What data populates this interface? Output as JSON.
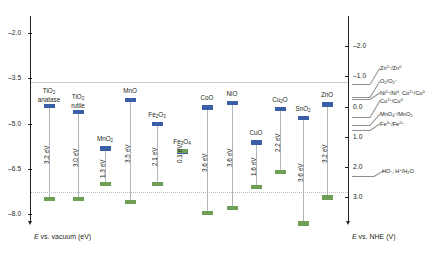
{
  "figure": {
    "left_axis_caption": "E vs. vacuum (eV)",
    "right_axis_caption": "E vs. NHE (V)"
  },
  "left_axis": {
    "ticks": [
      "-2.0",
      "-3.5",
      "-5.0",
      "-6.5",
      "-8.0"
    ],
    "values": [
      -2.0,
      -3.5,
      -5.0,
      -6.5,
      -8.0
    ]
  },
  "right_axis": {
    "ticks": [
      "-2.0",
      "-1.0",
      "0.0",
      "1.0",
      "2.0",
      "3.0"
    ],
    "values": [
      -2.0,
      -1.0,
      0.0,
      1.0,
      2.0,
      3.0
    ]
  },
  "redox_couples": [
    {
      "label": "Zn2+/Zn0",
      "value": -0.76
    },
    {
      "label": "O2/O2-",
      "value": -0.33
    },
    {
      "label": "Ni2+/Ni0, Co2+/Co0",
      "value": -0.26
    },
    {
      "label": "Cu2+/Cu0",
      "value": 0.34
    },
    {
      "label": "MnO4-/MnO2",
      "value": 0.6
    },
    {
      "label": "Fe3+/Fe2+",
      "value": 0.77
    },
    {
      "label": "HO., H+/H2O",
      "value": 2.3
    }
  ],
  "chart_data": {
    "type": "bar",
    "title": "",
    "xlabel": "",
    "ylabel": "E vs. vacuum (eV)",
    "ylim": [
      -8.6,
      -1.4
    ],
    "y2label": "E vs. NHE (V)",
    "y2lim": [
      4.1,
      -3.1
    ],
    "grid": false,
    "legend": "none",
    "reference_lines": [
      -4.5,
      -7.4
    ],
    "categories": [
      "TiO2 anatase",
      "TiO2 rutile",
      "MnO2",
      "MnO",
      "Fe2O3",
      "Fe3O4",
      "CoO",
      "NiO",
      "CuO",
      "Cu2O",
      "SnO2",
      "ZnO"
    ],
    "series": [
      {
        "name": "Conduction band edge (eV)",
        "values": [
          -4.35,
          -4.55,
          -5.75,
          -4.15,
          -4.95,
          -5.85,
          -4.4,
          -4.25,
          -5.55,
          -4.45,
          -4.75,
          -4.3
        ]
      },
      {
        "name": "Valence band edge (eV)",
        "values": [
          -7.55,
          -7.55,
          -7.05,
          -7.65,
          -7.05,
          -5.95,
          -8.0,
          -7.85,
          -7.15,
          -6.65,
          -8.35,
          -7.5
        ]
      },
      {
        "name": "Band gap (eV)",
        "values": [
          3.2,
          3.0,
          1.3,
          3.5,
          2.1,
          0.1,
          3.6,
          3.6,
          1.6,
          2.2,
          3.6,
          3.2
        ]
      }
    ],
    "gap_labels": [
      "3.2 eV",
      "3.0 eV",
      "1.3 eV",
      "3.5 eV",
      "2.1 eV",
      "0.1 eV",
      "3.6 eV",
      "3.6 eV",
      "1.6 eV",
      "2.2 eV",
      "3.6 eV",
      "3.2 eV"
    ],
    "colors": {
      "conduction_band": "#3b5ea8",
      "valence_band": "#6f9e55",
      "stem": "#b4b7b9",
      "axis": "#231f20"
    }
  },
  "materials": [
    {
      "name_html": "TiO<sub>2</sub><br>anatase",
      "gap": "3.2 eV"
    },
    {
      "name_html": "TiO<sub>2</sub><br>rutile",
      "gap": "3.0 eV"
    },
    {
      "name_html": "MnO<sub>2</sub>",
      "gap": "1.3 eV"
    },
    {
      "name_html": "MnO",
      "gap": "3.5 eV"
    },
    {
      "name_html": "Fe<sub>2</sub>O<sub>3</sub>",
      "gap": "2.1 eV"
    },
    {
      "name_html": "Fe<sub>3</sub>O<sub>4</sub>",
      "gap": "0.1 eV"
    },
    {
      "name_html": "CoO",
      "gap": "3.6 eV"
    },
    {
      "name_html": "NiO",
      "gap": "3.6 eV"
    },
    {
      "name_html": "CuO",
      "gap": "1.6 eV"
    },
    {
      "name_html": "Cu<sub>2</sub>O",
      "gap": "2.2 eV"
    },
    {
      "name_html": "SnO<sub>2</sub>",
      "gap": "3.6 eV"
    },
    {
      "name_html": "ZnO",
      "gap": "3.2 eV"
    }
  ],
  "redox_html": [
    "Zn<sup>2+</sup>/Zn<sup>0</sup>",
    "O<sub>2</sub>/O<sub>2</sub><sup>&#8211;</sup>",
    "Ni<sup>2+</sup>/Ni<sup>0</sup>, Co<sup>2+</sup>/Co<sup>0</sup>",
    "Cu<sup>2+</sup>/Cu<sup>0</sup>",
    "MnO<sub>4</sub><sup>&#8211;</sup>/MnO<sub>2</sub>",
    "Fe<sup>3+</sup>/Fe<sup>2+</sup>",
    "HO&#183;, H<sup>+</sup>/H<sub>2</sub>O"
  ]
}
